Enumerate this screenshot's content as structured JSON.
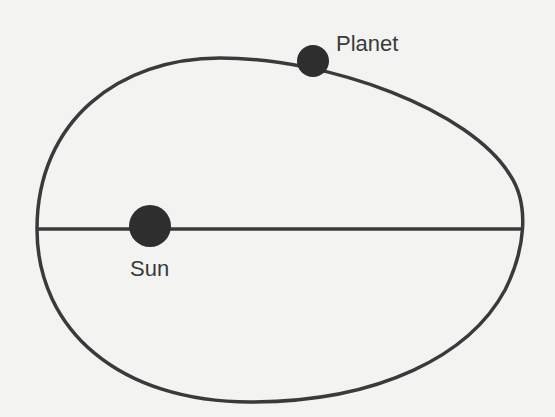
{
  "diagram": {
    "colors": {
      "background": "#f3f3f2",
      "stroke": "#3a3a3a",
      "body_fill": "#2e2e2e",
      "text": "#3a3a3a"
    },
    "orbit": {
      "shape": "ellipse",
      "left_x": 37,
      "right_x": 522,
      "axis_y": 229,
      "top_y": 60,
      "bottom_y": 400
    },
    "major_axis": {
      "x1": 37,
      "y1": 229,
      "x2": 522,
      "y2": 229
    },
    "bodies": [
      {
        "id": "planet",
        "label": "Planet",
        "cx": 313,
        "cy": 61,
        "r": 16
      },
      {
        "id": "sun",
        "label": "Sun",
        "cx": 150,
        "cy": 226,
        "r": 22
      }
    ]
  }
}
